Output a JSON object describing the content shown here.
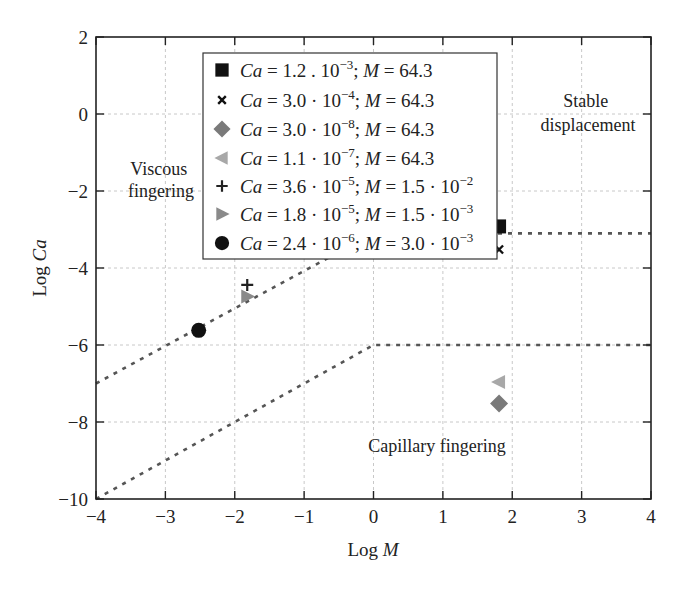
{
  "chart_data": {
    "type": "scatter",
    "title": "",
    "xlabel": "Log M",
    "ylabel": "Log Ca",
    "xlim": [
      -4,
      4
    ],
    "ylim": [
      -10,
      2
    ],
    "xticks": [
      -4,
      -3,
      -2,
      -1,
      0,
      1,
      2,
      3,
      4
    ],
    "yticks": [
      -10,
      -8,
      -6,
      -4,
      -2,
      0,
      2
    ],
    "xtick_labels": [
      "−4",
      "−3",
      "−2",
      "−1",
      "0",
      "1",
      "2",
      "3",
      "4"
    ],
    "ytick_labels": [
      "−10",
      "−8",
      "−6",
      "−4",
      "−2",
      "0",
      "2"
    ],
    "grid": true,
    "legend_position": "upper center",
    "series": [
      {
        "name": "Ca = 1.2 . 10⁻³; M = 64.3",
        "Ca": "1.2e-3",
        "M": "64.3",
        "marker": "square",
        "color": "#111111",
        "x": 1.81,
        "y": -2.92
      },
      {
        "name": "Ca = 3.0 · 10⁻⁴; M = 64.3",
        "Ca": "3.0e-4",
        "M": "64.3",
        "marker": "x",
        "color": "#111111",
        "x": 1.81,
        "y": -3.52
      },
      {
        "name": "Ca = 3.0 · 10⁻⁸; M = 64.3",
        "Ca": "3.0e-8",
        "M": "64.3",
        "marker": "diamond",
        "color": "#7a7a7a",
        "x": 1.81,
        "y": -7.52
      },
      {
        "name": "Ca = 1.1 · 10⁻⁷; M = 64.3",
        "Ca": "1.1e-7",
        "M": "64.3",
        "marker": "triangle-left",
        "color": "#a8a8a8",
        "x": 1.81,
        "y": -6.96
      },
      {
        "name": "Ca = 3.6 · 10⁻⁵; M = 1.5 · 10⁻²",
        "Ca": "3.6e-5",
        "M": "1.5e-2",
        "marker": "plus",
        "color": "#222222",
        "x": -1.82,
        "y": -4.44
      },
      {
        "name": "Ca = 1.8 · 10⁻⁵; M = 1.5 · 10⁻³",
        "Ca": "1.8e-5",
        "M": "1.5e-3",
        "marker": "triangle-right",
        "color": "#8a8a8a",
        "x": -1.82,
        "y": -4.74
      },
      {
        "name": "Ca = 2.4 · 10⁻⁶; M = 3.0 · 10⁻³",
        "Ca": "2.4e-6",
        "M": "3.0e-3",
        "marker": "circle",
        "color": "#111111",
        "x": -2.52,
        "y": -5.62
      }
    ],
    "boundary_lines": [
      {
        "name": "viscous-stable boundary",
        "style": "dotted",
        "points": [
          [
            -4,
            -7
          ],
          [
            0,
            -3.1
          ],
          [
            4,
            -3.1
          ]
        ]
      },
      {
        "name": "capillary boundary",
        "style": "dotted",
        "points": [
          [
            -4,
            -10
          ],
          [
            0,
            -6
          ],
          [
            4,
            -6
          ]
        ]
      }
    ],
    "annotations": [
      {
        "text": [
          "Viscous",
          "fingering"
        ],
        "x": -3.0,
        "y": -1.6
      },
      {
        "text": [
          "Stable",
          "displacement"
        ],
        "x": 3.05,
        "y": -0.4
      },
      {
        "text": [
          "Capillary fingering"
        ],
        "x": 1.0,
        "y": -8.7
      }
    ]
  },
  "legend": {
    "items": [
      {
        "pre": "Ca",
        "mid": " = 1.2 . 10",
        "exp1": "−3",
        "m": "; ",
        "mvar": "M",
        "post": " = 64.3",
        "exp2": ""
      },
      {
        "pre": "Ca",
        "mid": " = 3.0 · 10",
        "exp1": "−4",
        "m": "; ",
        "mvar": "M",
        "post": " = 64.3",
        "exp2": ""
      },
      {
        "pre": "Ca",
        "mid": " = 3.0 · 10",
        "exp1": "−8",
        "m": "; ",
        "mvar": "M",
        "post": " = 64.3",
        "exp2": ""
      },
      {
        "pre": "Ca",
        "mid": " = 1.1 · 10",
        "exp1": "−7",
        "m": "; ",
        "mvar": "M",
        "post": " = 64.3",
        "exp2": ""
      },
      {
        "pre": "Ca",
        "mid": " = 3.6 · 10",
        "exp1": "−5",
        "m": "; ",
        "mvar": "M",
        "post": " = 1.5 · 10",
        "exp2": "−2"
      },
      {
        "pre": "Ca",
        "mid": " = 1.8 · 10",
        "exp1": "−5",
        "m": "; ",
        "mvar": "M",
        "post": " = 1.5 · 10",
        "exp2": "−3"
      },
      {
        "pre": "Ca",
        "mid": " = 2.4 · 10",
        "exp1": "−6",
        "m": "; ",
        "mvar": "M",
        "post": " = 3.0 · 10",
        "exp2": "−3"
      }
    ]
  },
  "axes": {
    "x_title_pre": "Log ",
    "x_title_var": "M",
    "y_title_pre": "Log ",
    "y_title_var": "Ca"
  },
  "regions": {
    "viscous_line1": "Viscous",
    "viscous_line2": "fingering",
    "stable_line1": "Stable",
    "stable_line2": "displacement",
    "capillary": "Capillary fingering"
  }
}
